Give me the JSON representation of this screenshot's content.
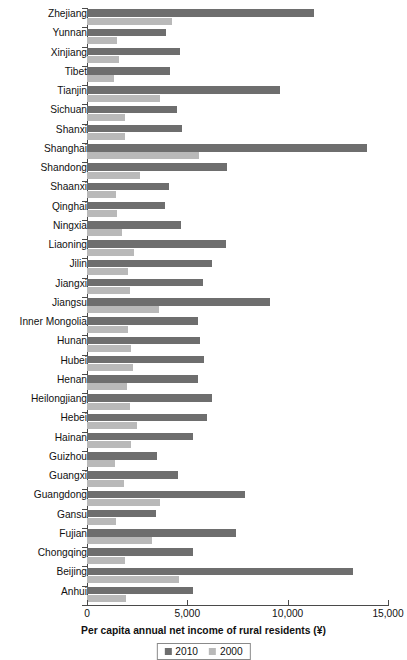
{
  "chart_data": {
    "type": "bar",
    "orientation": "horizontal",
    "title": "",
    "xlabel": "Per capita annual net income of rural residents (¥)",
    "ylabel": "",
    "xlim": [
      0,
      15000
    ],
    "xticks": [
      0,
      5000,
      10000,
      15000
    ],
    "xticklabels": [
      "0",
      "5,000",
      "10,000",
      "15,000"
    ],
    "grid": false,
    "legend_position": "bottom-center",
    "categories": [
      "Zhejiang",
      "Yunnan",
      "Xinjiang",
      "Tibet",
      "Tianjin",
      "Sichuan",
      "Shanxi",
      "Shanghai",
      "Shandong",
      "Shaanxi",
      "Qinghai",
      "Ningxia",
      "Liaoning",
      "Jilin",
      "Jiangxi",
      "Jiangsu",
      "Inner Mongolia",
      "Hunan",
      "Hubei",
      "Henan",
      "Heilongjiang",
      "Hebei",
      "Hainan",
      "Guizhou",
      "Guangxi",
      "Guangdong",
      "Gansu",
      "Fujian",
      "Chongqing",
      "Beijing",
      "Anhui"
    ],
    "series": [
      {
        "name": "2010",
        "color": "#6e6e6e",
        "values": [
          11303,
          3952,
          4643,
          4139,
          9618,
          4462,
          4737,
          13978,
          6990,
          4105,
          3863,
          4675,
          6908,
          6237,
          5789,
          9118,
          5530,
          5622,
          5832,
          5524,
          6211,
          5958,
          5275,
          3472,
          4543,
          7890,
          3425,
          7427,
          5277,
          13262,
          5285
        ]
      },
      {
        "name": "2000",
        "color": "#b9b9b9",
        "values": [
          4254,
          1479,
          1618,
          1331,
          3622,
          1904,
          1906,
          5596,
          2659,
          1444,
          1490,
          1724,
          2356,
          2022,
          2135,
          3595,
          2038,
          2197,
          2269,
          1986,
          2148,
          2479,
          2182,
          1374,
          1865,
          3654,
          1429,
          3230,
          1892,
          4605,
          1935
        ]
      }
    ],
    "legend_entries": [
      "2010",
      "2000"
    ]
  },
  "axis": {
    "x_title": "Per capita annual net income of rural residents (¥)"
  }
}
